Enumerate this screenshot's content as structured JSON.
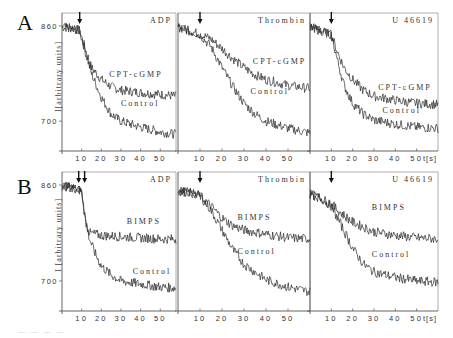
{
  "figure": {
    "row_labels": [
      "A",
      "B"
    ],
    "y_axis_label_A": "I[arbitrary units]",
    "y_axis_label_B": "I [arbitrary units]",
    "y_ticks": [
      "860",
      "700"
    ],
    "x_ticks": [
      "10",
      "20",
      "30",
      "40",
      "50"
    ],
    "x_unit": "t[s]",
    "colors": {
      "trace": "#2a2a2a",
      "axis": "#555555",
      "frame": "#9a9a9a",
      "text": "#333333"
    }
  },
  "chart_data": [
    {
      "type": "line",
      "row": "A",
      "title": "ADP",
      "xlabel": "",
      "ylabel": "I[arbitrary units]",
      "xlim": [
        0,
        58
      ],
      "ylim": [
        660,
        875
      ],
      "y_ticks": [
        860,
        700
      ],
      "x_ticks": [
        10,
        20,
        30,
        40,
        50
      ],
      "arrow_at": [
        9
      ],
      "legend_position": "inline-labels",
      "x": [
        0,
        5,
        9,
        12,
        15,
        20,
        25,
        30,
        40,
        50,
        58
      ],
      "series": [
        {
          "name": "CPT-cGMP",
          "values": [
            858,
            856,
            852,
            820,
            790,
            770,
            758,
            752,
            748,
            745,
            742
          ],
          "label_at": [
            24,
            775
          ]
        },
        {
          "name": "Control",
          "values": [
            858,
            856,
            852,
            815,
            780,
            740,
            712,
            700,
            690,
            682,
            678
          ],
          "label_at": [
            30,
            725
          ]
        }
      ]
    },
    {
      "type": "line",
      "row": "A",
      "title": "Thrombin",
      "xlabel": "",
      "ylabel": "",
      "xlim": [
        0,
        60
      ],
      "ylim": [
        660,
        875
      ],
      "x_ticks": [
        10,
        20,
        30,
        40,
        50
      ],
      "arrow_at": [
        10
      ],
      "legend_position": "inline-labels",
      "x": [
        0,
        5,
        10,
        15,
        20,
        25,
        30,
        35,
        40,
        50,
        60
      ],
      "series": [
        {
          "name": "CPT-cGMP",
          "values": [
            858,
            852,
            846,
            838,
            822,
            805,
            790,
            778,
            770,
            760,
            755
          ],
          "label_at": [
            34,
            796
          ]
        },
        {
          "name": "Control",
          "values": [
            858,
            852,
            845,
            825,
            790,
            758,
            730,
            712,
            700,
            688,
            680
          ],
          "label_at": [
            33,
            745
          ]
        }
      ]
    },
    {
      "type": "line",
      "row": "A",
      "title": "U 46619",
      "xlabel": "t[s]",
      "ylabel": "",
      "xlim": [
        0,
        60
      ],
      "ylim": [
        660,
        875
      ],
      "x_ticks": [
        10,
        20,
        30,
        40,
        50
      ],
      "arrow_at": [
        10
      ],
      "legend_position": "inline-labels",
      "x": [
        0,
        5,
        10,
        13,
        16,
        20,
        25,
        30,
        40,
        50,
        60
      ],
      "series": [
        {
          "name": "CPT-cGMP",
          "values": [
            858,
            852,
            845,
            815,
            790,
            770,
            752,
            742,
            735,
            730,
            728
          ],
          "label_at": [
            32,
            752
          ]
        },
        {
          "name": "Control",
          "values": [
            858,
            852,
            845,
            800,
            760,
            730,
            712,
            702,
            695,
            690,
            688
          ],
          "label_at": [
            34,
            713
          ]
        }
      ]
    },
    {
      "type": "line",
      "row": "B",
      "title": "ADP",
      "xlabel": "",
      "ylabel": "I [arbitrary units]",
      "xlim": [
        0,
        58
      ],
      "ylim": [
        660,
        875
      ],
      "y_ticks": [
        860,
        700
      ],
      "x_ticks": [
        10,
        20,
        30,
        40,
        50
      ],
      "arrow_at": [
        9,
        11
      ],
      "legend_position": "inline-labels",
      "x": [
        0,
        5,
        10,
        12,
        14,
        17,
        20,
        25,
        30,
        40,
        50,
        58
      ],
      "series": [
        {
          "name": "BIMPS",
          "values": [
            858,
            856,
            850,
            800,
            780,
            778,
            776,
            775,
            774,
            772,
            770,
            770
          ],
          "label_at": [
            33,
            795
          ]
        },
        {
          "name": "Control",
          "values": [
            858,
            856,
            850,
            800,
            770,
            745,
            725,
            710,
            700,
            695,
            690,
            688
          ],
          "label_at": [
            36,
            712
          ]
        }
      ]
    },
    {
      "type": "line",
      "row": "B",
      "title": "Thrombin",
      "xlabel": "",
      "ylabel": "",
      "xlim": [
        0,
        60
      ],
      "ylim": [
        660,
        875
      ],
      "x_ticks": [
        10,
        20,
        30,
        40,
        50
      ],
      "arrow_at": [
        10
      ],
      "legend_position": "inline-labels",
      "x": [
        0,
        5,
        10,
        15,
        20,
        25,
        30,
        40,
        50,
        60
      ],
      "series": [
        {
          "name": "BIMPS",
          "values": [
            850,
            848,
            842,
            825,
            805,
            792,
            785,
            778,
            772,
            770
          ],
          "label_at": [
            27,
            802
          ]
        },
        {
          "name": "Control",
          "values": [
            850,
            848,
            842,
            818,
            785,
            752,
            728,
            702,
            690,
            682
          ],
          "label_at": [
            27,
            745
          ]
        }
      ]
    },
    {
      "type": "line",
      "row": "B",
      "title": "U 46619",
      "xlabel": "t[s]",
      "ylabel": "",
      "xlim": [
        0,
        60
      ],
      "ylim": [
        660,
        875
      ],
      "x_ticks": [
        10,
        20,
        30,
        40,
        50
      ],
      "arrow_at": [
        10
      ],
      "legend_position": "inline-labels",
      "x": [
        0,
        5,
        10,
        15,
        20,
        25,
        30,
        40,
        50,
        60
      ],
      "series": [
        {
          "name": "BIMPS",
          "values": [
            845,
            838,
            828,
            812,
            798,
            790,
            782,
            776,
            772,
            770
          ],
          "label_at": [
            29,
            818
          ]
        },
        {
          "name": "Control",
          "values": [
            845,
            838,
            825,
            790,
            755,
            728,
            715,
            706,
            700,
            698
          ],
          "label_at": [
            29,
            740
          ]
        }
      ]
    }
  ]
}
